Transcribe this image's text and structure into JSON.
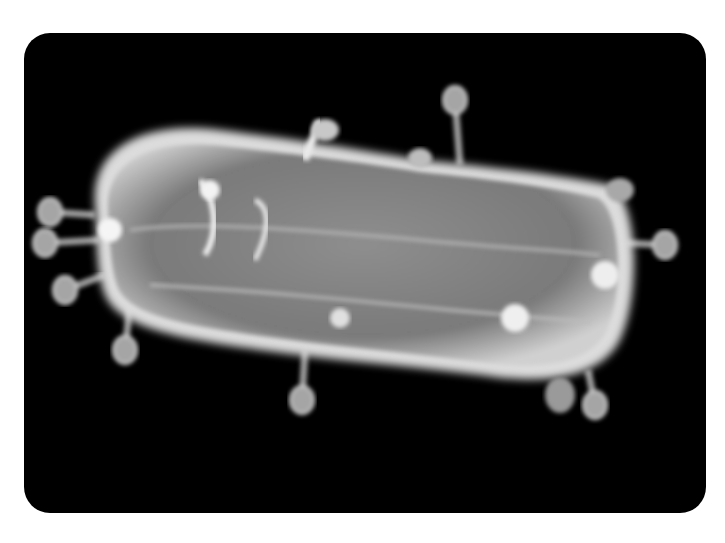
{
  "image": {
    "caption": "Scanning electron micrograph: bacteriophages attached to a rod-shaped bacterium",
    "background": "#000000",
    "page_background": "#ffffff",
    "subject": "bacterium",
    "body_color": "#8a8a8a",
    "highlight_color": "#e6e6e6",
    "phages": [
      {
        "hx": 455,
        "hy": 100,
        "tx": 460,
        "ty": 165
      },
      {
        "hx": 50,
        "hy": 212,
        "tx": 95,
        "ty": 215
      },
      {
        "hx": 45,
        "hy": 243,
        "tx": 100,
        "ty": 240
      },
      {
        "hx": 65,
        "hy": 290,
        "tx": 105,
        "ty": 275
      },
      {
        "hx": 125,
        "hy": 350,
        "tx": 130,
        "ty": 305
      },
      {
        "hx": 302,
        "hy": 400,
        "tx": 305,
        "ty": 350
      },
      {
        "hx": 665,
        "hy": 245,
        "tx": 625,
        "ty": 243
      },
      {
        "hx": 595,
        "hy": 405,
        "tx": 588,
        "ty": 370
      },
      {
        "hx": 330,
        "hy": 320,
        "tx": 340,
        "ty": 300
      },
      {
        "hx": 515,
        "hy": 325,
        "tx": 525,
        "ty": 280
      }
    ]
  }
}
